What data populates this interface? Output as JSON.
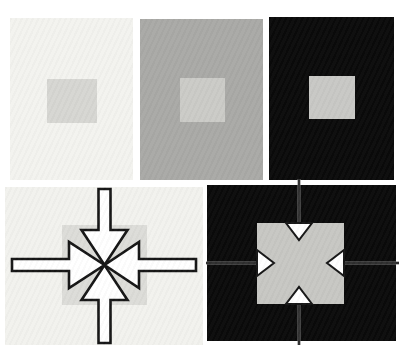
{
  "figure": {
    "panel_count": 5,
    "text": ""
  },
  "palette": {
    "page_background": "#ffffff",
    "black": "#0a0a0a",
    "white": "#ffffff",
    "outline": "#151515"
  },
  "panels": {
    "top_left": {
      "background": "#f3f3ef",
      "square": "#d6d6d2"
    },
    "top_middle": {
      "background": "#a9a9a6",
      "square": "#cbcbc7"
    },
    "top_right": {
      "background": "#0a0a0a",
      "square": "#c8c8c5"
    },
    "bottom_left": {
      "background": "#f2f2ee",
      "square": "#dcdcd8",
      "arrow_fill": "#ffffff",
      "arrow_outline": "#151515"
    },
    "bottom_right": {
      "background": "#0a0a0a",
      "square": "#c7c7c3",
      "arrowhead_fill": "#ffffff",
      "arrowhead_outline": "#151515",
      "seam_line": "#161616",
      "seam_halo": "#787878"
    }
  }
}
